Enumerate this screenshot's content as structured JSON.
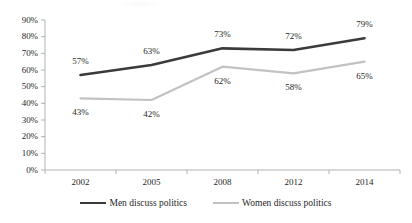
{
  "chart_data": {
    "type": "line",
    "title": "",
    "subtitle": "",
    "xlabel": "",
    "ylabel": "",
    "categories": [
      "2002",
      "2005",
      "2008",
      "2012",
      "2014"
    ],
    "series": [
      {
        "name": "Men discuss politics",
        "color": "#3b3b3b",
        "values": [
          57,
          63,
          73,
          72,
          79
        ],
        "labels": [
          "57%",
          "63%",
          "73%",
          "72%",
          "79%"
        ],
        "label_position": "above"
      },
      {
        "name": "Women discuss politics",
        "color": "#c2c2c2",
        "values": [
          43,
          42,
          62,
          58,
          65
        ],
        "labels": [
          "43%",
          "42%",
          "62%",
          "58%",
          "65%"
        ],
        "label_position": "below"
      }
    ],
    "ylim": [
      0,
      90
    ],
    "ytick_labels": [
      "90%",
      "80%",
      "70%",
      "60%",
      "50%",
      "40%",
      "30%",
      "20%",
      "10%",
      "0%"
    ],
    "ytick_values": [
      90,
      80,
      70,
      60,
      50,
      40,
      30,
      20,
      10,
      0
    ],
    "grid": false,
    "legend_position": "bottom"
  },
  "axis": {
    "y_axis_name": "y-axis",
    "x_axis_name": "x-axis"
  },
  "legend": {
    "items": [
      {
        "label": "Men discuss politics"
      },
      {
        "label": "Women discuss politics"
      }
    ]
  }
}
